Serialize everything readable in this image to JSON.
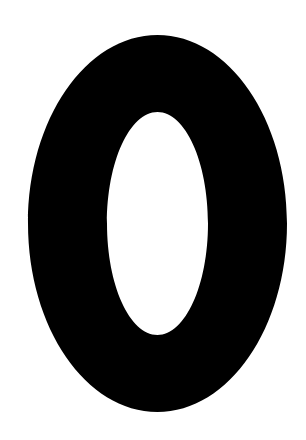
{
  "canvas": {
    "width": 306,
    "height": 440,
    "background_color": "#ffffff",
    "alt_text": "0"
  },
  "glyph": {
    "character": "0",
    "name": "digit-zero",
    "fill_color": "#000000",
    "counter_color": "#ffffff",
    "outer": {
      "center_x": 157.5,
      "center_y": 223.5,
      "radius_x": 129.5,
      "radius_y": 188.5,
      "left": 28,
      "right": 287,
      "top": 35,
      "bottom": 412
    },
    "counter": {
      "center_x": 157.5,
      "center_y": 223.5,
      "radius_x": 50.5,
      "radius_y": 111.5,
      "left": 107,
      "right": 208,
      "top": 112,
      "bottom": 335
    },
    "stroke_width_side": 79,
    "stroke_width_cap": 77
  }
}
